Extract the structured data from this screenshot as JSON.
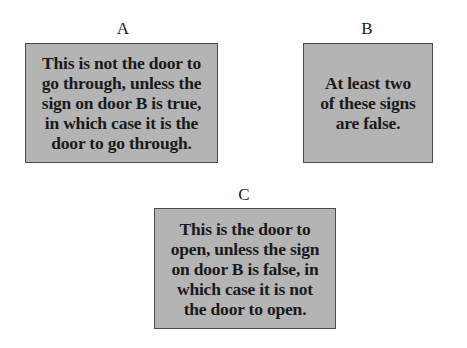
{
  "doors": [
    {
      "label": "A",
      "sign_lines": [
        "This is not the door to",
        "go through, unless the",
        "sign on door B is true,",
        "in which case it is the",
        "door to go through."
      ]
    },
    {
      "label": "B",
      "sign_lines": [
        "At least two",
        "of these signs",
        "are false."
      ]
    },
    {
      "label": "C",
      "sign_lines": [
        "This is the door to",
        "open, unless the sign",
        "on door B is false, in",
        "which case it is not",
        "the door to open."
      ]
    }
  ],
  "colors": {
    "sign_fill": "#b4b4b4",
    "sign_border": "#4a4a4a",
    "text": "#1a1a1a",
    "background": "#ffffff"
  }
}
